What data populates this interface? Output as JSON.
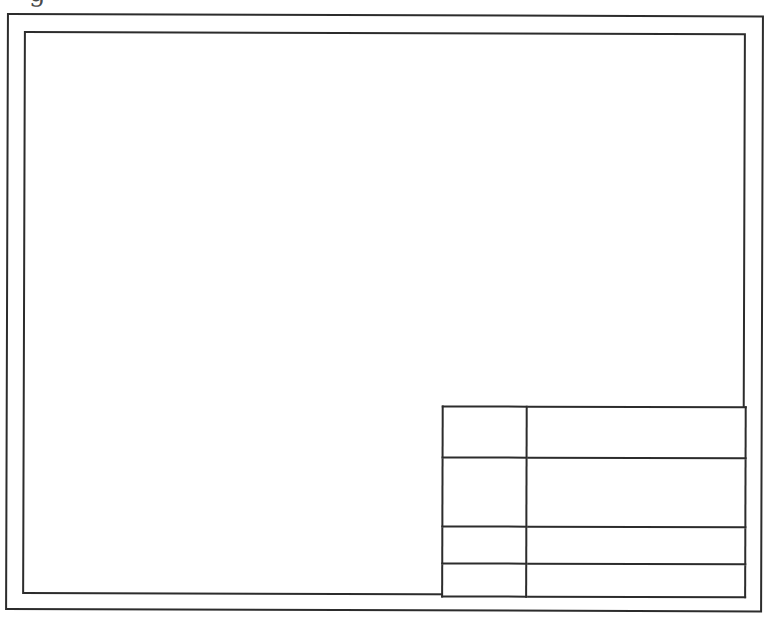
{
  "page": {
    "background_color": "#ffffff",
    "line_color": "#2c2c2c",
    "caption_fragment": "g"
  },
  "sheet": {
    "description_visible_elements": "blank drawing sheet with double border frame and title block",
    "outer_border_present": true,
    "inner_border_present": true
  },
  "title_block": {
    "columns": 2,
    "rows": 4,
    "cells": [
      [
        "",
        ""
      ],
      [
        "",
        ""
      ],
      [
        "",
        ""
      ],
      [
        "",
        ""
      ]
    ]
  }
}
